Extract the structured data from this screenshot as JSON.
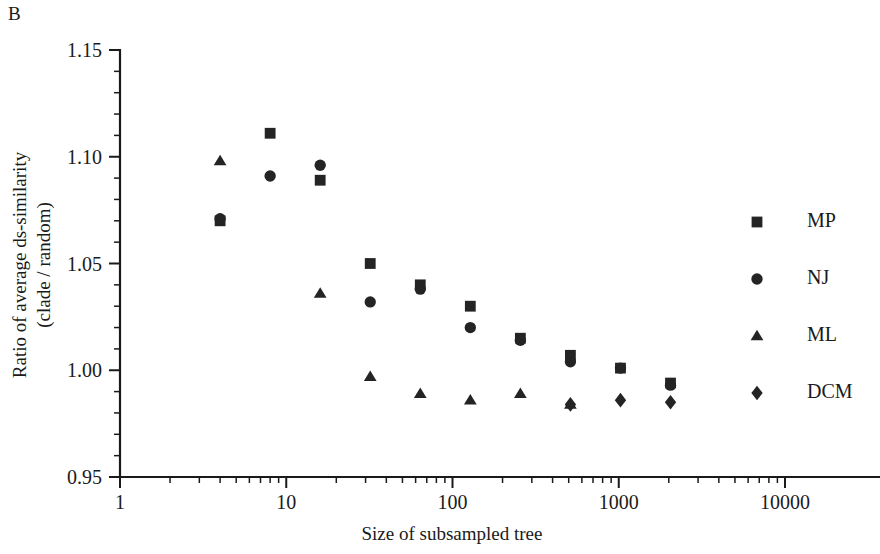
{
  "panel": {
    "label": "B"
  },
  "chart_data": {
    "type": "scatter",
    "title": "",
    "xlabel": "Size of subsampled tree",
    "ylabel": "Ratio of average ds-similarity (clade / random)",
    "ylabel_line1": "Ratio of average ds-similarity",
    "ylabel_line2": "(clade / random)",
    "xscale": "log",
    "yscale": "linear",
    "xlim": [
      1,
      10000
    ],
    "ylim": [
      0.95,
      1.15
    ],
    "grid": false,
    "legend_position": "right",
    "x_ticks": [
      1,
      10,
      100,
      1000,
      10000
    ],
    "x_tick_labels": [
      "1",
      "10",
      "100",
      "1000",
      "10000"
    ],
    "y_ticks": [
      0.95,
      1.0,
      1.05,
      1.1,
      1.15
    ],
    "y_tick_labels": [
      "0.95",
      "1.00",
      "1.05",
      "1.10",
      "1.15"
    ],
    "y_minor_step": 0.01,
    "marker_color": "#242424",
    "series": [
      {
        "name": "MP",
        "marker": "square",
        "x": [
          4,
          8,
          16,
          32,
          64,
          128,
          256,
          512,
          1024,
          2048
        ],
        "y": [
          1.07,
          1.111,
          1.089,
          1.05,
          1.04,
          1.03,
          1.015,
          1.007,
          1.001,
          0.994
        ]
      },
      {
        "name": "NJ",
        "marker": "circle",
        "x": [
          4,
          8,
          16,
          32,
          64,
          128,
          256,
          512,
          1024,
          2048
        ],
        "y": [
          1.071,
          1.091,
          1.096,
          1.032,
          1.038,
          1.02,
          1.014,
          1.004,
          1.001,
          0.993
        ]
      },
      {
        "name": "ML",
        "marker": "triangle",
        "x": [
          4,
          16,
          32,
          64,
          128,
          256,
          512
        ],
        "y": [
          1.098,
          1.036,
          0.997,
          0.989,
          0.986,
          0.989,
          0.984
        ]
      },
      {
        "name": "DCM",
        "marker": "diamond",
        "x": [
          512,
          1024,
          2048
        ],
        "y": [
          0.984,
          0.986,
          0.985
        ]
      }
    ],
    "legend_entries": [
      {
        "label": "MP",
        "marker": "square"
      },
      {
        "label": "NJ",
        "marker": "circle"
      },
      {
        "label": "ML",
        "marker": "triangle"
      },
      {
        "label": "DCM",
        "marker": "diamond"
      }
    ]
  }
}
